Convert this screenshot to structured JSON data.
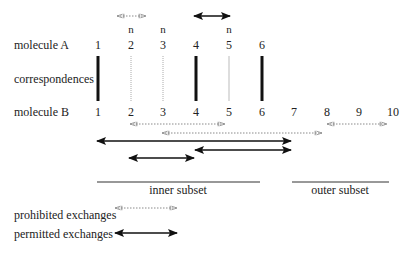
{
  "labels": {
    "molecule_a": "molecule A",
    "correspondences": "correspondences",
    "molecule_b": "molecule B",
    "inner_subset": "inner subset",
    "outer_subset": "outer subset",
    "prohibited": "prohibited exchanges",
    "permitted": "permitted exchanges"
  },
  "molecule_a": {
    "positions": [
      "1",
      "2",
      "3",
      "4",
      "5",
      "6"
    ],
    "n_marks": [
      "",
      "n",
      "n",
      "",
      "n",
      ""
    ]
  },
  "molecule_b": {
    "positions": [
      "1",
      "2",
      "3",
      "4",
      "5",
      "6",
      "7",
      "8",
      "9",
      "10"
    ]
  },
  "correspondences": [
    {
      "from": 1,
      "to": 1,
      "type": "strong"
    },
    {
      "from": 2,
      "to": 2,
      "type": "weak"
    },
    {
      "from": 3,
      "to": 3,
      "type": "weak"
    },
    {
      "from": 4,
      "to": 4,
      "type": "strong"
    },
    {
      "from": 5,
      "to": 5,
      "type": "weak"
    },
    {
      "from": 6,
      "to": 6,
      "type": "strong"
    }
  ],
  "exchanges_a": [
    {
      "from": 2,
      "to": 3,
      "type": "prohibited"
    },
    {
      "from": 4,
      "to": 5,
      "type": "permitted"
    }
  ],
  "exchanges_b": [
    {
      "from": 2,
      "to": 5,
      "type": "prohibited"
    },
    {
      "from": 8,
      "to": 10,
      "type": "prohibited"
    },
    {
      "from": 3,
      "to": 8,
      "type": "prohibited"
    },
    {
      "from": 1,
      "to": 7,
      "type": "permitted"
    },
    {
      "from": 4,
      "to": 7,
      "type": "permitted"
    },
    {
      "from": 2,
      "to": 4,
      "type": "permitted"
    }
  ],
  "subsets": {
    "inner": {
      "from": 1,
      "to": 6
    },
    "outer": {
      "from": 7,
      "to": 10
    }
  },
  "colors": {
    "text": "#222222",
    "strong": "#111111",
    "weak": "#9a9a9a"
  }
}
